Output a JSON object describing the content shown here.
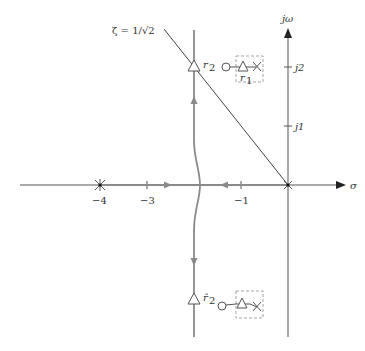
{
  "diagram": {
    "type": "root-locus",
    "axes": {
      "real_label": "σ",
      "imag_label": "jω",
      "real_ticks": [
        {
          "value": -4,
          "label": "−4"
        },
        {
          "value": -3,
          "label": "−3"
        },
        {
          "value": -1,
          "label": "−1"
        }
      ],
      "imag_ticks": [
        {
          "value": 1,
          "label": "j1"
        },
        {
          "value": 2,
          "label": "j2"
        }
      ]
    },
    "damping_line": {
      "label": "ζ = 1/√2"
    },
    "points": {
      "r2_label": "r",
      "r2_sub": "2",
      "r2hat_label": "r̂",
      "r2hat_sub": "2",
      "r1_label": "r",
      "r1_sub": "1"
    },
    "poles": [
      {
        "sigma": -4,
        "omega": 0,
        "symbol": "×",
        "note": "pole at −4 (with dot)"
      },
      {
        "sigma": 0,
        "omega": 0,
        "symbol": "×",
        "note": "pole at origin"
      }
    ],
    "insets": [
      {
        "position": "upper",
        "components": [
          "zero-circle",
          "triangle",
          "pole-x"
        ],
        "label": "r1"
      },
      {
        "position": "lower",
        "components": [
          "zero-circle",
          "triangle",
          "pole-x"
        ]
      }
    ],
    "colors": {
      "axis": "#555555",
      "locus": "#8a8a8a",
      "dashed_box": "#999999",
      "text": "#333333"
    }
  }
}
